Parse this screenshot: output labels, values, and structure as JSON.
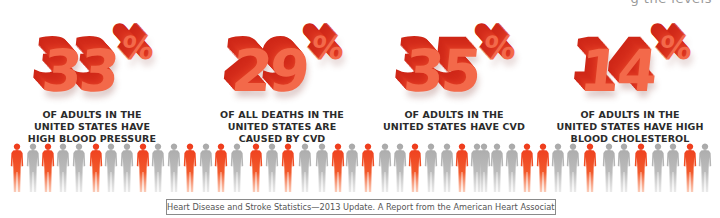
{
  "header": {
    "clipped_text": "g the levels"
  },
  "stats": [
    {
      "value": "33",
      "unit": "%",
      "caption_lines": [
        "OF ADULTS IN THE",
        "UNITED STATES HAVE",
        "HIGH BLOOD PRESSURE"
      ]
    },
    {
      "value": "29",
      "unit": "%",
      "caption_lines": [
        "OF ALL DEATHS IN THE",
        "UNITED STATES ARE",
        "CAUSED BY CVD"
      ]
    },
    {
      "value": "35",
      "unit": "%",
      "caption_lines": [
        "OF ADULTS IN THE",
        "UNITED STATES HAVE CVD"
      ]
    },
    {
      "value": "14",
      "unit": "%",
      "caption_lines": [
        "OF ADULTS IN THE",
        "UNITED STATES HAVE HIGH",
        "BLOOD CHOLESTEROL"
      ]
    }
  ],
  "colors": {
    "number_face": "#f3694a",
    "number_extrusion": "#d22a19",
    "caption_text": "#2b2b2b",
    "person_highlight": "#f04a22",
    "person_gray": "#b5b5b5"
  },
  "people_row": {
    "figures": [
      "O",
      "G",
      "O",
      "G",
      "G",
      "O",
      "G",
      "G",
      "O",
      "G",
      "G",
      "O",
      "G",
      "O",
      "G",
      "O",
      "G",
      "O",
      "G",
      "G",
      "O",
      "G",
      "O",
      "G",
      "G",
      "O",
      "G",
      "G",
      "O",
      "G",
      "G",
      "G",
      "G",
      "O",
      "O",
      "G",
      "G",
      "O",
      "G",
      "G",
      "O",
      "G",
      "G",
      "O",
      "G"
    ],
    "positions": [
      17,
      33,
      48,
      63,
      79,
      96,
      111,
      127,
      143,
      158,
      174,
      190,
      206,
      221,
      237,
      256,
      272,
      288,
      305,
      322,
      338,
      352,
      368,
      385,
      400,
      415,
      431,
      447,
      462,
      477,
      484,
      497,
      512,
      527,
      543,
      558,
      573,
      590,
      609,
      624,
      641,
      658,
      673,
      690,
      705
    ]
  },
  "source": {
    "text": "Heart Disease and Stroke Statistics—2013 Update. A Report from the American Heart Association"
  }
}
